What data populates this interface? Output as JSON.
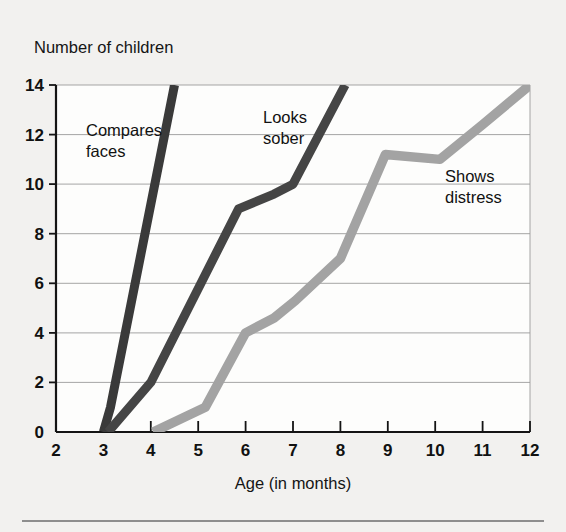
{
  "chart_data": {
    "type": "line",
    "title": "",
    "subtitle": "",
    "xlabel": "Age (in months)",
    "ylabel": "Number of children",
    "xlim": [
      2,
      12
    ],
    "ylim": [
      0,
      14
    ],
    "xticks": [
      2,
      3,
      4,
      5,
      6,
      7,
      8,
      9,
      10,
      11,
      12
    ],
    "yticks": [
      0,
      2,
      4,
      6,
      8,
      10,
      12,
      14
    ],
    "xtick_labels": [
      "2",
      "3",
      "4",
      "5",
      "6",
      "7",
      "8",
      "9",
      "10",
      "11",
      "12"
    ],
    "ytick_labels": [
      "0",
      "2",
      "4",
      "6",
      "8",
      "10",
      "12",
      "14"
    ],
    "grid": "horizontal",
    "legend_position": "inline-annotations",
    "series": [
      {
        "name": "Compares faces",
        "color": "#3a3a3a",
        "label_lines": [
          "Compares",
          "faces"
        ],
        "points": [
          {
            "x": 3.0,
            "y": 0
          },
          {
            "x": 3.15,
            "y": 1.0
          },
          {
            "x": 4.5,
            "y": 14
          }
        ]
      },
      {
        "name": "Looks sober",
        "color": "#454545",
        "label_lines": [
          "Looks",
          "sober"
        ],
        "points": [
          {
            "x": 3.1,
            "y": 0
          },
          {
            "x": 4.0,
            "y": 2.0
          },
          {
            "x": 5.85,
            "y": 9.0
          },
          {
            "x": 6.6,
            "y": 9.6
          },
          {
            "x": 7.0,
            "y": 10.0
          },
          {
            "x": 8.1,
            "y": 14
          }
        ]
      },
      {
        "name": "Shows distress",
        "color": "#a3a3a3",
        "label_lines": [
          "Shows",
          "distress"
        ],
        "points": [
          {
            "x": 4.05,
            "y": 0
          },
          {
            "x": 5.15,
            "y": 1.0
          },
          {
            "x": 6.0,
            "y": 4.0
          },
          {
            "x": 6.6,
            "y": 4.6
          },
          {
            "x": 7.05,
            "y": 5.3
          },
          {
            "x": 8.0,
            "y": 7.0
          },
          {
            "x": 8.95,
            "y": 11.2
          },
          {
            "x": 10.1,
            "y": 11.0
          },
          {
            "x": 11.0,
            "y": 12.4
          },
          {
            "x": 12.0,
            "y": 14
          }
        ]
      }
    ],
    "annotations": [
      {
        "text": "Compares faces",
        "x": 3.35,
        "y": 12.3
      },
      {
        "text": "Looks sober",
        "x": 6.05,
        "y": 13.1
      },
      {
        "text": "Shows distress",
        "x": 9.55,
        "y": 10.9
      }
    ]
  }
}
